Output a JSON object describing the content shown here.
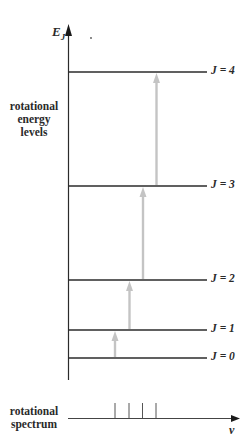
{
  "diagram": {
    "y_axis_label": "E",
    "y_axis_subscript": "J",
    "x_axis_label": "ν",
    "left_label_levels": [
      "rotational",
      "energy",
      "levels"
    ],
    "left_label_spectrum": [
      "rotational",
      "spectrum"
    ],
    "levels": [
      {
        "label": "J = 0",
        "y": 358
      },
      {
        "label": "J = 1",
        "y": 330
      },
      {
        "label": "J = 2",
        "y": 280
      },
      {
        "label": "J = 3",
        "y": 186
      },
      {
        "label": "J = 4",
        "y": 72
      }
    ],
    "transitions": [
      {
        "from": "J = 0",
        "to": "J = 1",
        "x": 115
      },
      {
        "from": "J = 1",
        "to": "J = 2",
        "x": 130
      },
      {
        "from": "J = 2",
        "to": "J = 3",
        "x": 143
      },
      {
        "from": "J = 3",
        "to": "J = 4",
        "x": 157
      }
    ],
    "spectrum_lines_x": [
      115,
      129,
      142,
      156
    ],
    "colors": {
      "line": "#2b2b2b",
      "arrow": "#c4c4c4",
      "text": "#2a2a2a"
    }
  }
}
